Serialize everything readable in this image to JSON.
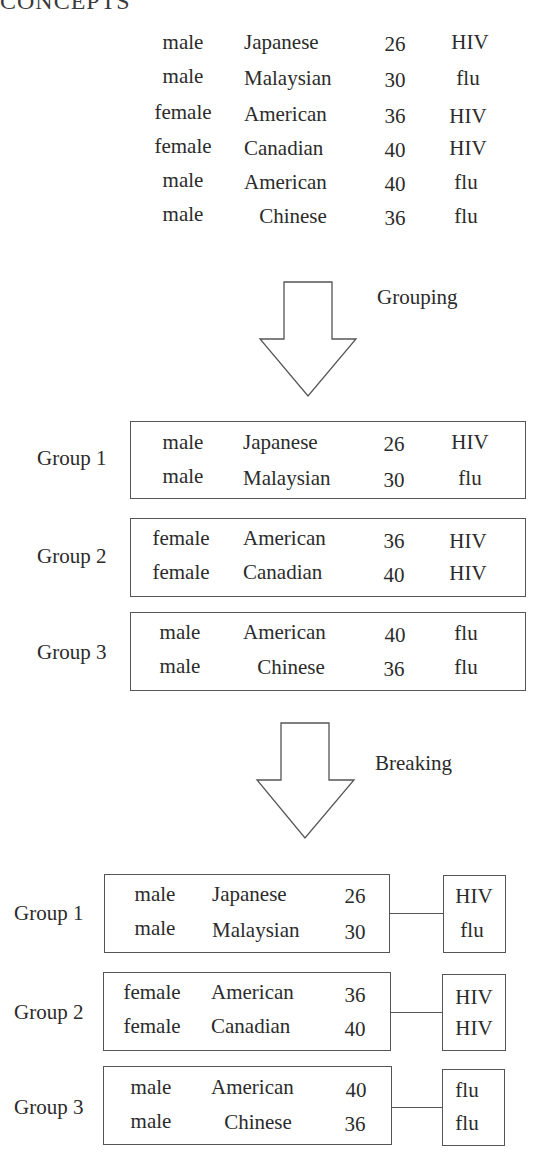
{
  "header": {
    "title_partial": "CONCEPTS"
  },
  "original_table": {
    "rows": [
      {
        "gender": "male",
        "nationality": "Japanese",
        "age": "26",
        "disease": "HIV"
      },
      {
        "gender": "male",
        "nationality": "Malaysian",
        "age": "30",
        "disease": "flu"
      },
      {
        "gender": "female",
        "nationality": "American",
        "age": "36",
        "disease": "HIV"
      },
      {
        "gender": "female",
        "nationality": "Canadian",
        "age": "40",
        "disease": "HIV"
      },
      {
        "gender": "male",
        "nationality": "American",
        "age": "40",
        "disease": "flu"
      },
      {
        "gender": "male",
        "nationality": "Chinese",
        "age": "36",
        "disease": "flu"
      }
    ]
  },
  "steps": {
    "grouping": {
      "label": "Grouping"
    },
    "breaking": {
      "label": "Breaking"
    }
  },
  "grouped": [
    {
      "label": "Group 1",
      "rows": [
        {
          "gender": "male",
          "nationality": "Japanese",
          "age": "26",
          "disease": "HIV"
        },
        {
          "gender": "male",
          "nationality": "Malaysian",
          "age": "30",
          "disease": "flu"
        }
      ]
    },
    {
      "label": "Group 2",
      "rows": [
        {
          "gender": "female",
          "nationality": "American",
          "age": "36",
          "disease": "HIV"
        },
        {
          "gender": "female",
          "nationality": "Canadian",
          "age": "40",
          "disease": "HIV"
        }
      ]
    },
    {
      "label": "Group 3",
      "rows": [
        {
          "gender": "male",
          "nationality": "American",
          "age": "40",
          "disease": "flu"
        },
        {
          "gender": "male",
          "nationality": "Chinese",
          "age": "36",
          "disease": "flu"
        }
      ]
    }
  ],
  "broken": [
    {
      "label": "Group 1",
      "quasi": [
        {
          "gender": "male",
          "nationality": "Japanese",
          "age": "26"
        },
        {
          "gender": "male",
          "nationality": "Malaysian",
          "age": "30"
        }
      ],
      "sensitive": [
        "HIV",
        "flu"
      ]
    },
    {
      "label": "Group 2",
      "quasi": [
        {
          "gender": "female",
          "nationality": "American",
          "age": "36"
        },
        {
          "gender": "female",
          "nationality": "Canadian",
          "age": "40"
        }
      ],
      "sensitive": [
        "HIV",
        "HIV"
      ]
    },
    {
      "label": "Group 3",
      "quasi": [
        {
          "gender": "male",
          "nationality": "American",
          "age": "40"
        },
        {
          "gender": "male",
          "nationality": "Chinese",
          "age": "36"
        }
      ],
      "sensitive": [
        "flu",
        "flu"
      ]
    }
  ],
  "colors": {
    "text": "#2b2b2b",
    "stroke": "#555555",
    "background": "#ffffff"
  }
}
